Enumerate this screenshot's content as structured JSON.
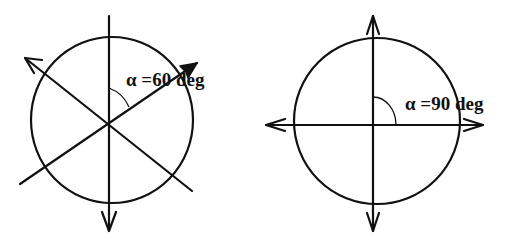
{
  "figures": [
    {
      "id": "left",
      "label": "α =60 deg",
      "angle_deg": 60,
      "description": "Circle with three lines through center spaced 60 degrees apart"
    },
    {
      "id": "right",
      "label": "α =90 deg",
      "angle_deg": 90,
      "description": "Circle with two perpendicular lines through center"
    }
  ],
  "colors": {
    "ink": "#111111",
    "background": "#ffffff"
  }
}
